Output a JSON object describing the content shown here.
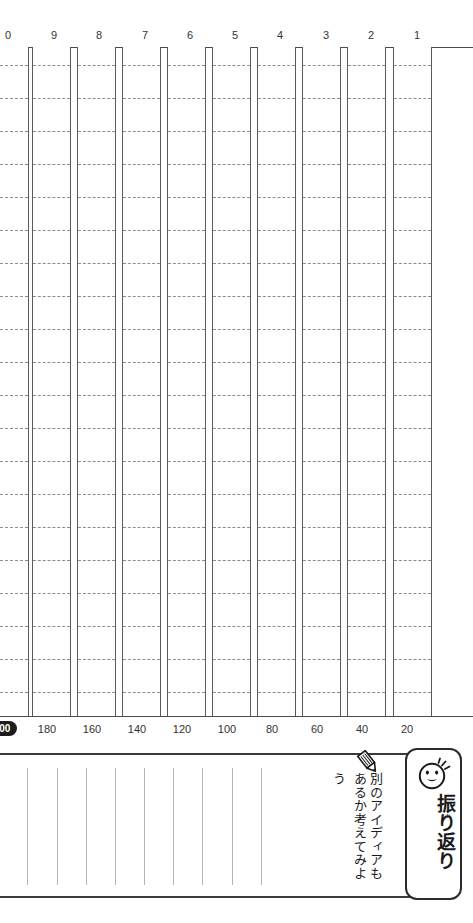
{
  "worksheet": {
    "type": "genko-yoshi",
    "columns_total": 10,
    "rows_per_column": 20,
    "total_characters": 200
  },
  "column_ruler": {
    "labels": [
      "0",
      "9",
      "8",
      "7",
      "6",
      "5",
      "4",
      "3",
      "2",
      "1"
    ],
    "positions": [
      8,
      54,
      99,
      145,
      190,
      235,
      280,
      326,
      371,
      417
    ]
  },
  "count_ruler": {
    "labels": [
      "200",
      "180",
      "160",
      "140",
      "120",
      "100",
      "80",
      "60",
      "40",
      "20"
    ],
    "positions": [
      2,
      47,
      92,
      137,
      182,
      227,
      272,
      317,
      362,
      407
    ],
    "badge_label": "200",
    "badge_color": "#1d1d1d"
  },
  "reflection": {
    "icon_smiley": "smiley-face-icon",
    "icon_pencil": "pencil-icon",
    "title": "振り返り",
    "title_furigana": "ふ",
    "prompt_lines": [
      "別のアイディアも",
      "あるか考えてみよ",
      "う"
    ],
    "rule_count": 9,
    "rule_positions": [
      27,
      57,
      86,
      115,
      144,
      173,
      202,
      232,
      261
    ]
  },
  "grid": {
    "column_lefts": [
      -10,
      32,
      77,
      122,
      167,
      212,
      257,
      302,
      347,
      393
    ],
    "column_width": 39,
    "row_line_tops": [
      18,
      51,
      84,
      117,
      150,
      183,
      216,
      249,
      282,
      315,
      348,
      381,
      414,
      447,
      480,
      513,
      546,
      579,
      612,
      645
    ],
    "line_color": "#5a5a5a",
    "dash_color": "#8d8d8d"
  }
}
